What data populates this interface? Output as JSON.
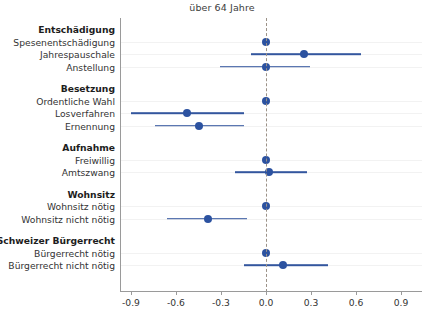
{
  "chart_data": {
    "type": "scatter",
    "title": "über 64 Jahre",
    "xlabel": "",
    "ylabel": "",
    "xlim": [
      -1.05,
      1.05
    ],
    "xticks": [
      -0.9,
      -0.6,
      -0.3,
      0.0,
      0.3,
      0.6,
      0.9
    ],
    "xtick_labels": [
      "-0.9",
      "-0.6",
      "-0.3",
      "0.0",
      "0.3",
      "0.6",
      "0.9"
    ],
    "grid": false,
    "legend": "none",
    "reference_line": 0.0,
    "reference_line_style": "dashed",
    "point_color": "#2c52a0",
    "line_color": "#33569e",
    "orientation": "horizontal",
    "groups": [
      {
        "label": "Entschädigung",
        "items": [
          {
            "label": "Spesenentschädigung",
            "estimate": 0.0,
            "ci_low": null,
            "ci_high": null,
            "reference": true
          },
          {
            "label": "Jahrespauschale",
            "estimate": 0.25,
            "ci_low": -0.1,
            "ci_high": 0.63,
            "reference": false
          },
          {
            "label": "Anstellung",
            "estimate": 0.0,
            "ci_low": -0.31,
            "ci_high": 0.29,
            "reference": false
          }
        ]
      },
      {
        "label": "Besetzung",
        "items": [
          {
            "label": "Ordentliche Wahl",
            "estimate": 0.0,
            "ci_low": null,
            "ci_high": null,
            "reference": true
          },
          {
            "label": "Losverfahren",
            "estimate": -0.53,
            "ci_low": -0.9,
            "ci_high": -0.15,
            "reference": false
          },
          {
            "label": "Ernennung",
            "estimate": -0.45,
            "ci_low": -0.74,
            "ci_high": -0.15,
            "reference": false
          }
        ]
      },
      {
        "label": "Aufnahme",
        "items": [
          {
            "label": "Freiwillig",
            "estimate": 0.0,
            "ci_low": null,
            "ci_high": null,
            "reference": true
          },
          {
            "label": "Amtszwang",
            "estimate": 0.02,
            "ci_low": -0.21,
            "ci_high": 0.27,
            "reference": false
          }
        ]
      },
      {
        "label": "Wohnsitz",
        "items": [
          {
            "label": "Wohnsitz nötig",
            "estimate": 0.0,
            "ci_low": null,
            "ci_high": null,
            "reference": true
          },
          {
            "label": "Wohnsitz nicht nötig",
            "estimate": -0.39,
            "ci_low": -0.66,
            "ci_high": -0.13,
            "reference": false
          }
        ]
      },
      {
        "label": "Schweizer Bürgerrecht",
        "items": [
          {
            "label": "Bürgerrecht nötig",
            "estimate": 0.0,
            "ci_low": null,
            "ci_high": null,
            "reference": true
          },
          {
            "label": "Bürgerrecht nicht nötig",
            "estimate": 0.11,
            "ci_low": -0.15,
            "ci_high": 0.41,
            "reference": false
          }
        ]
      }
    ]
  }
}
